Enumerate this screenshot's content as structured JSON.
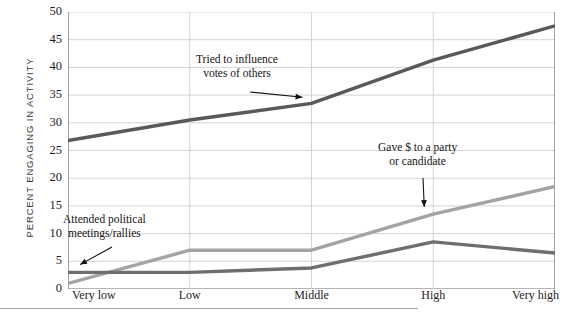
{
  "chart_data": {
    "type": "line",
    "title": "",
    "xlabel": "",
    "ylabel": "PERCENT ENGAGING IN ACTIVITY",
    "categories": [
      "Very low",
      "Low",
      "Middle",
      "High",
      "Very high"
    ],
    "ylim": [
      0,
      50
    ],
    "yticks": [
      0,
      5,
      10,
      15,
      20,
      25,
      30,
      35,
      40,
      45,
      50
    ],
    "ytick_labels": [
      "0",
      "5",
      "10",
      "15",
      "20",
      "25",
      "30",
      "35",
      "40",
      "45",
      "50"
    ],
    "grid": true,
    "legend": "annotations",
    "series": [
      {
        "name": "Tried to influence votes of others",
        "color": "#595959",
        "values": [
          26.8,
          30.5,
          33.5,
          41.3,
          47.5
        ]
      },
      {
        "name": "Gave $ to a party or candidate",
        "color": "#a3a3a3",
        "values": [
          1.0,
          7.0,
          7.0,
          13.5,
          18.5
        ]
      },
      {
        "name": "Attended political meetings/rallies",
        "color": "#6e6e6e",
        "values": [
          3.0,
          3.0,
          3.8,
          8.5,
          6.5
        ]
      }
    ],
    "annotations": [
      {
        "id": "influence",
        "lines": [
          "Tried to influence",
          "votes of others"
        ],
        "target_category": "Middle",
        "target_value": 33.5
      },
      {
        "id": "gave",
        "lines": [
          "Gave $ to a party",
          "or candidate"
        ],
        "target_category": "High",
        "target_value": 13.5
      },
      {
        "id": "attended",
        "lines": [
          "Attended political",
          "meetings/rallies"
        ],
        "target_category": "Very low",
        "target_value": 3.0
      }
    ]
  },
  "colors": {
    "axis": "#6a6a6a",
    "grid": "#cfcfcf",
    "text": "#1d1d1d",
    "background": "#ffffff",
    "footrule": "#a9a9a9"
  }
}
